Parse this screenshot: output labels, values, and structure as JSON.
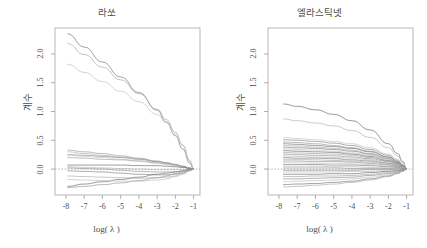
{
  "figure": {
    "background": "#ffffff",
    "foreground": "#4d4d4d",
    "width": 427,
    "height": 248
  },
  "panels": [
    {
      "id": "lasso",
      "title": "라쏘",
      "xlabel": "log( λ )",
      "ylabel": "계수"
    },
    {
      "id": "elasticnet",
      "title": "엘라스틱넷",
      "xlabel": "log( λ )",
      "ylabel": "계수"
    }
  ],
  "chart_data": [
    {
      "type": "line",
      "id": "lasso",
      "title": "라쏘",
      "xlabel": "log( λ )",
      "ylabel": "계수",
      "xlim": [
        -8.6,
        -0.65
      ],
      "ylim": [
        -0.45,
        2.45
      ],
      "xticks": [
        -8,
        -7,
        -6,
        -5,
        -4,
        -3,
        -2,
        -1
      ],
      "xticklabels": [
        "-8",
        "-7",
        "-6",
        "-5",
        "-4",
        "-3",
        "-2",
        "-1"
      ],
      "yticks": [
        0.0,
        0.5,
        1.0,
        1.5,
        2.0
      ],
      "yticklabels": [
        "0.0",
        "0.5",
        "1.0",
        "1.5",
        "2.0"
      ],
      "grid": false,
      "legend": "none",
      "zero_reference_line": {
        "y": 0.0,
        "style": "dashed"
      },
      "x": [
        -7.9,
        -7.0,
        -6.0,
        -5.0,
        -4.0,
        -3.0,
        -2.5,
        -2.0,
        -1.6,
        -1.2,
        -1.0
      ],
      "series": [
        {
          "name": "coef-1",
          "color": "#7a7a7a",
          "values": [
            2.35,
            2.12,
            1.86,
            1.6,
            1.33,
            1.02,
            0.82,
            0.58,
            0.35,
            0.1,
            0.0
          ]
        },
        {
          "name": "coef-2",
          "color": "#a8a8a8",
          "values": [
            2.18,
            1.99,
            1.77,
            1.55,
            1.31,
            1.04,
            0.86,
            0.64,
            0.42,
            0.14,
            0.0
          ]
        },
        {
          "name": "coef-3",
          "color": "#c2c2c2",
          "values": [
            1.82,
            1.68,
            1.52,
            1.35,
            1.17,
            0.95,
            0.8,
            0.61,
            0.41,
            0.15,
            0.0
          ]
        },
        {
          "name": "coef-4",
          "color": "#9d9d9d",
          "values": [
            0.33,
            0.3,
            0.27,
            0.23,
            0.19,
            0.14,
            0.11,
            0.08,
            0.05,
            0.02,
            0.0
          ]
        },
        {
          "name": "coef-5",
          "color": "#b0b0b0",
          "values": [
            0.3,
            0.27,
            0.24,
            0.21,
            0.18,
            0.13,
            0.1,
            0.07,
            0.04,
            0.01,
            0.0
          ]
        },
        {
          "name": "coef-6",
          "color": "#8d8d8d",
          "values": [
            0.25,
            0.24,
            0.22,
            0.2,
            0.17,
            0.13,
            0.11,
            0.08,
            0.05,
            0.02,
            0.0
          ]
        },
        {
          "name": "coef-7",
          "color": "#c8c8c8",
          "values": [
            0.24,
            0.22,
            0.2,
            0.17,
            0.14,
            0.1,
            0.08,
            0.05,
            0.03,
            0.01,
            0.0
          ]
        },
        {
          "name": "coef-8",
          "color": "#a0a0a0",
          "values": [
            0.2,
            0.19,
            0.17,
            0.16,
            0.14,
            0.11,
            0.09,
            0.07,
            0.04,
            0.01,
            0.0
          ]
        },
        {
          "name": "coef-9",
          "color": "#707070",
          "values": [
            0.07,
            0.07,
            0.07,
            0.07,
            0.06,
            0.06,
            0.05,
            0.04,
            0.03,
            0.01,
            0.0
          ]
        },
        {
          "name": "coef-10",
          "color": "#b8b8b8",
          "values": [
            0.04,
            0.03,
            0.02,
            0.01,
            0.0,
            -0.01,
            -0.01,
            -0.01,
            -0.01,
            0.0,
            0.0
          ]
        },
        {
          "name": "coef-11",
          "color": "#959595",
          "values": [
            0.02,
            0.01,
            0.0,
            -0.02,
            -0.04,
            -0.05,
            -0.05,
            -0.05,
            -0.04,
            -0.01,
            0.0
          ]
        },
        {
          "name": "coef-12",
          "color": "#858585",
          "values": [
            -0.03,
            -0.04,
            -0.05,
            -0.07,
            -0.09,
            -0.1,
            -0.1,
            -0.09,
            -0.07,
            -0.02,
            0.0
          ]
        },
        {
          "name": "coef-13",
          "color": "#aeaeae",
          "values": [
            -0.12,
            -0.13,
            -0.14,
            -0.15,
            -0.16,
            -0.15,
            -0.14,
            -0.12,
            -0.08,
            -0.03,
            0.0
          ]
        },
        {
          "name": "coef-14",
          "color": "#6f6f6f",
          "values": [
            -0.3,
            -0.26,
            -0.22,
            -0.18,
            -0.14,
            -0.09,
            -0.07,
            -0.05,
            -0.03,
            -0.01,
            0.0
          ]
        },
        {
          "name": "coef-15",
          "color": "#9a9a9a",
          "values": [
            -0.32,
            -0.3,
            -0.27,
            -0.24,
            -0.2,
            -0.15,
            -0.12,
            -0.08,
            -0.05,
            -0.02,
            0.0
          ]
        },
        {
          "name": "coef-16",
          "color": "#bdbdbd",
          "values": [
            -0.18,
            -0.19,
            -0.2,
            -0.21,
            -0.21,
            -0.19,
            -0.17,
            -0.13,
            -0.09,
            -0.03,
            0.0
          ]
        }
      ]
    },
    {
      "type": "line",
      "id": "elasticnet",
      "title": "엘라스틱넷",
      "xlabel": "log( λ )",
      "ylabel": "계수",
      "xlim": [
        -8.6,
        -0.65
      ],
      "ylim": [
        -0.45,
        2.45
      ],
      "xticks": [
        -8,
        -7,
        -6,
        -5,
        -4,
        -3,
        -2,
        -1
      ],
      "xticklabels": [
        "-8",
        "-7",
        "-6",
        "-5",
        "-4",
        "-3",
        "-2",
        "-1"
      ],
      "yticks": [
        0.0,
        0.5,
        1.0,
        1.5,
        2.0
      ],
      "yticklabels": [
        "0.0",
        "0.5",
        "1.0",
        "1.5",
        "2.0"
      ],
      "grid": false,
      "legend": "none",
      "zero_reference_line": {
        "y": 0.0,
        "style": "dashed"
      },
      "x": [
        -7.75,
        -7.0,
        -6.0,
        -5.0,
        -4.0,
        -3.0,
        -2.0,
        -1.5,
        -1.2,
        -1.0
      ],
      "series": [
        {
          "name": "coef-1",
          "color": "#6f6f6f",
          "values": [
            1.13,
            1.09,
            1.03,
            0.95,
            0.84,
            0.68,
            0.44,
            0.27,
            0.13,
            0.0
          ]
        },
        {
          "name": "coef-2",
          "color": "#b5b5b5",
          "values": [
            0.87,
            0.84,
            0.8,
            0.75,
            0.67,
            0.55,
            0.37,
            0.23,
            0.11,
            0.0
          ]
        },
        {
          "name": "coef-3",
          "color": "#c4c4c4",
          "values": [
            0.55,
            0.53,
            0.51,
            0.48,
            0.44,
            0.37,
            0.26,
            0.17,
            0.08,
            0.0
          ]
        },
        {
          "name": "coef-4",
          "color": "#8a8a8a",
          "values": [
            0.51,
            0.5,
            0.48,
            0.45,
            0.41,
            0.34,
            0.24,
            0.15,
            0.07,
            0.0
          ]
        },
        {
          "name": "coef-5",
          "color": "#9b9b9b",
          "values": [
            0.47,
            0.46,
            0.44,
            0.41,
            0.37,
            0.31,
            0.21,
            0.13,
            0.06,
            0.0
          ]
        },
        {
          "name": "coef-6",
          "color": "#777777",
          "values": [
            0.44,
            0.43,
            0.41,
            0.39,
            0.36,
            0.3,
            0.21,
            0.13,
            0.06,
            0.0
          ]
        },
        {
          "name": "coef-7",
          "color": "#adadad",
          "values": [
            0.41,
            0.4,
            0.38,
            0.36,
            0.33,
            0.27,
            0.19,
            0.12,
            0.06,
            0.0
          ]
        },
        {
          "name": "coef-8",
          "color": "#838383",
          "values": [
            0.38,
            0.37,
            0.36,
            0.34,
            0.31,
            0.26,
            0.18,
            0.11,
            0.05,
            0.0
          ]
        },
        {
          "name": "coef-9",
          "color": "#c0c0c0",
          "values": [
            0.35,
            0.34,
            0.33,
            0.31,
            0.28,
            0.24,
            0.17,
            0.1,
            0.05,
            0.0
          ]
        },
        {
          "name": "coef-10",
          "color": "#6c6c6c",
          "values": [
            0.32,
            0.31,
            0.3,
            0.29,
            0.26,
            0.22,
            0.15,
            0.1,
            0.05,
            0.0
          ]
        },
        {
          "name": "coef-11",
          "color": "#a4a4a4",
          "values": [
            0.29,
            0.28,
            0.27,
            0.26,
            0.24,
            0.2,
            0.14,
            0.09,
            0.04,
            0.0
          ]
        },
        {
          "name": "coef-12",
          "color": "#8f8f8f",
          "values": [
            0.26,
            0.25,
            0.24,
            0.23,
            0.21,
            0.18,
            0.13,
            0.08,
            0.04,
            0.0
          ]
        },
        {
          "name": "coef-13",
          "color": "#b9b9b9",
          "values": [
            0.23,
            0.22,
            0.21,
            0.2,
            0.19,
            0.16,
            0.11,
            0.07,
            0.03,
            0.0
          ]
        },
        {
          "name": "coef-14",
          "color": "#7d7d7d",
          "values": [
            0.2,
            0.19,
            0.19,
            0.18,
            0.16,
            0.14,
            0.1,
            0.06,
            0.03,
            0.0
          ]
        },
        {
          "name": "coef-15",
          "color": "#a9a9a9",
          "values": [
            0.17,
            0.17,
            0.16,
            0.15,
            0.14,
            0.12,
            0.08,
            0.05,
            0.03,
            0.0
          ]
        },
        {
          "name": "coef-16",
          "color": "#949494",
          "values": [
            0.14,
            0.14,
            0.13,
            0.13,
            0.12,
            0.1,
            0.07,
            0.04,
            0.02,
            0.0
          ]
        },
        {
          "name": "coef-17",
          "color": "#c6c6c6",
          "values": [
            0.11,
            0.11,
            0.1,
            0.1,
            0.09,
            0.08,
            0.05,
            0.03,
            0.02,
            0.0
          ]
        },
        {
          "name": "coef-18",
          "color": "#818181",
          "values": [
            0.08,
            0.08,
            0.08,
            0.07,
            0.07,
            0.06,
            0.04,
            0.03,
            0.01,
            0.0
          ]
        },
        {
          "name": "coef-19",
          "color": "#b2b2b2",
          "values": [
            0.05,
            0.05,
            0.05,
            0.04,
            0.04,
            0.03,
            0.02,
            0.02,
            0.01,
            0.0
          ]
        },
        {
          "name": "coef-20",
          "color": "#9e9e9e",
          "values": [
            0.02,
            0.02,
            0.02,
            0.02,
            0.01,
            0.01,
            0.01,
            0.01,
            0.0,
            0.0
          ]
        },
        {
          "name": "coef-21",
          "color": "#888888",
          "values": [
            -0.02,
            -0.02,
            -0.02,
            -0.02,
            -0.02,
            -0.01,
            -0.01,
            -0.01,
            0.0,
            0.0
          ]
        },
        {
          "name": "coef-22",
          "color": "#bbbbbb",
          "values": [
            -0.05,
            -0.05,
            -0.05,
            -0.05,
            -0.04,
            -0.04,
            -0.03,
            -0.02,
            -0.01,
            0.0
          ]
        },
        {
          "name": "coef-23",
          "color": "#747474",
          "values": [
            -0.09,
            -0.09,
            -0.09,
            -0.08,
            -0.08,
            -0.06,
            -0.04,
            -0.03,
            -0.01,
            0.0
          ]
        },
        {
          "name": "coef-24",
          "color": "#a6a6a6",
          "values": [
            -0.13,
            -0.13,
            -0.12,
            -0.12,
            -0.11,
            -0.09,
            -0.06,
            -0.04,
            -0.02,
            0.0
          ]
        },
        {
          "name": "coef-25",
          "color": "#919191",
          "values": [
            -0.17,
            -0.17,
            -0.16,
            -0.15,
            -0.14,
            -0.11,
            -0.08,
            -0.05,
            -0.02,
            0.0
          ]
        },
        {
          "name": "coef-26",
          "color": "#c2c2c2",
          "values": [
            -0.22,
            -0.21,
            -0.2,
            -0.19,
            -0.17,
            -0.14,
            -0.1,
            -0.06,
            -0.03,
            0.0
          ]
        },
        {
          "name": "coef-27",
          "color": "#7b7b7b",
          "values": [
            -0.27,
            -0.26,
            -0.25,
            -0.23,
            -0.21,
            -0.17,
            -0.12,
            -0.07,
            -0.03,
            0.0
          ]
        },
        {
          "name": "coef-28",
          "color": "#aaaaaa",
          "values": [
            -0.31,
            -0.3,
            -0.28,
            -0.26,
            -0.23,
            -0.19,
            -0.13,
            -0.08,
            -0.04,
            0.0
          ]
        }
      ]
    }
  ]
}
